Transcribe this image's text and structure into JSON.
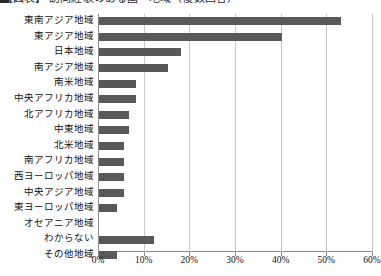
{
  "title": {
    "text": "【図表】 訪問経験のある国・地域（複数回答）",
    "clipped": true
  },
  "chart_data": {
    "type": "bar",
    "orientation": "horizontal",
    "title": "",
    "xlabel": "",
    "ylabel": "",
    "xlim": [
      0,
      60
    ],
    "xticks": [
      0,
      10,
      20,
      30,
      40,
      50,
      60
    ],
    "xticklabels": [
      "0%",
      "10%",
      "20%",
      "30%",
      "40%",
      "50%",
      "60%"
    ],
    "grid": true,
    "legend": false,
    "bar_color": "#595959",
    "categories": [
      "東南アジア地域",
      "東アジア地域",
      "日本地域",
      "南アジア地域",
      "南米地域",
      "中央アフリカ地域",
      "北アフリカ地域",
      "中東地域",
      "北米地域",
      "南アフリカ地域",
      "西ヨーロッパ地域",
      "中央アジア地域",
      "東ヨーロッパ地域",
      "オセアニア地域",
      "わからない",
      "その他地域"
    ],
    "values": [
      53.0,
      40.0,
      18.0,
      15.0,
      8.0,
      8.0,
      6.5,
      6.5,
      5.5,
      5.5,
      5.5,
      5.5,
      4.0,
      0.0,
      12.0,
      4.0
    ]
  },
  "axis": {
    "tick_labels": [
      "0%",
      "10%",
      "20%",
      "30%",
      "40%",
      "50%",
      "60%"
    ]
  }
}
